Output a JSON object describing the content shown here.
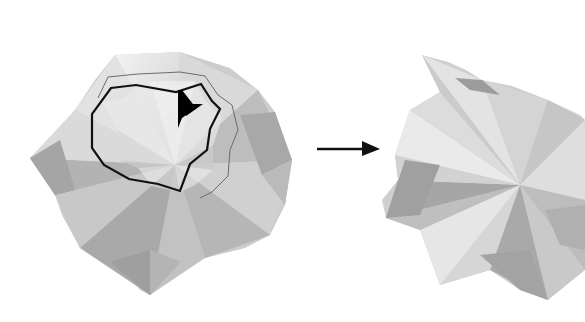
{
  "diagram": {
    "type": "origami-step",
    "background": "#ffffff",
    "paper_light": "#ececec",
    "paper_mid": "#c9c9c9",
    "paper_dark": "#9e9e9e",
    "outline_color": "#111111",
    "steps": [
      {
        "id": "before",
        "label": "",
        "has_outline": true,
        "has_push_arrow": true
      },
      {
        "id": "after",
        "label": "",
        "has_outline": false,
        "has_push_arrow": false
      }
    ],
    "transition_arrow": {
      "direction": "right"
    }
  }
}
